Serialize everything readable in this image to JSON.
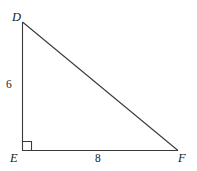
{
  "figure": {
    "type": "right-triangle-diagram",
    "background_color": "#ffffff",
    "stroke_color": "#3a3a3a",
    "vertices": {
      "top_left": {
        "label": "D",
        "x": 22,
        "y": 22
      },
      "bottom_left": {
        "label": "E",
        "x": 22,
        "y": 150
      },
      "bottom_right": {
        "label": "F",
        "x": 178,
        "y": 150
      }
    },
    "side_labels": {
      "vertical_leg": "6",
      "horizontal_leg": "8"
    },
    "right_angle": {
      "at_vertex": "E",
      "marker": "square",
      "size": 8
    }
  }
}
